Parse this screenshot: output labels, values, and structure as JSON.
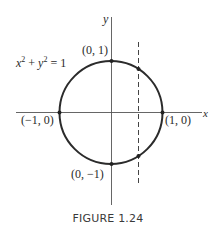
{
  "figure": {
    "caption": "FIGURE 1.24",
    "equation": {
      "lhs_x": "x",
      "exp1": "2",
      "plus": "+",
      "lhs_y": "y",
      "exp2": "2",
      "rhs": "= 1"
    },
    "axes": {
      "x_label": "x",
      "y_label": "y"
    },
    "points": [
      {
        "label": "(0, 1)",
        "x": 0,
        "y": 1
      },
      {
        "label": "(1, 0)",
        "x": 1,
        "y": 0
      },
      {
        "label": "(0, −1)",
        "x": 0,
        "y": -1
      },
      {
        "label": "(−1, 0)",
        "x": -1,
        "y": 0
      }
    ],
    "dashed_line": {
      "description": "vertical line x = c (0 < c < 1) meeting circle at two points"
    },
    "colors": {
      "curve": "#2b2b2b",
      "axis": "#555555",
      "text": "#2a2a2a"
    }
  }
}
